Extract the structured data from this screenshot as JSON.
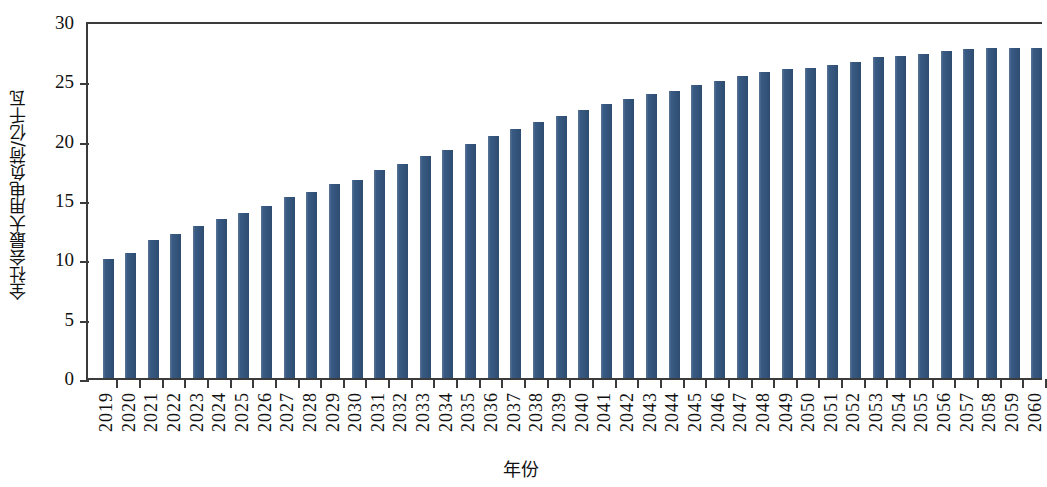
{
  "chart_data": {
    "type": "bar",
    "title": "",
    "xlabel": "年份",
    "ylabel": "全社会最大用电负荷/亿千瓦",
    "ylim": [
      0,
      30
    ],
    "yticks": [
      0,
      5,
      10,
      15,
      20,
      25,
      30
    ],
    "grid": false,
    "legend": null,
    "bar_color": "#355780",
    "axis_color": "#3b3b3b",
    "categories": [
      "2019",
      "2020",
      "2021",
      "2022",
      "2023",
      "2024",
      "2025",
      "2026",
      "2027",
      "2028",
      "2029",
      "2030",
      "2031",
      "2032",
      "2033",
      "2034",
      "2035",
      "2036",
      "2037",
      "2038",
      "2039",
      "2040",
      "2041",
      "2042",
      "2043",
      "2044",
      "2045",
      "2046",
      "2047",
      "2048",
      "2049",
      "2050",
      "2051",
      "2052",
      "2053",
      "2054",
      "2055",
      "2056",
      "2057",
      "2058",
      "2059",
      "2060"
    ],
    "values": [
      10.1,
      10.6,
      11.7,
      12.2,
      12.9,
      13.5,
      14.0,
      14.6,
      15.3,
      15.8,
      16.4,
      16.8,
      17.6,
      18.1,
      18.8,
      19.3,
      19.8,
      20.5,
      21.1,
      21.7,
      22.2,
      22.7,
      23.2,
      23.6,
      24.0,
      24.3,
      24.8,
      25.1,
      25.5,
      25.9,
      26.1,
      26.2,
      26.5,
      26.7,
      27.1,
      27.2,
      27.4,
      27.6,
      27.8,
      27.9,
      27.9,
      27.9
    ]
  }
}
